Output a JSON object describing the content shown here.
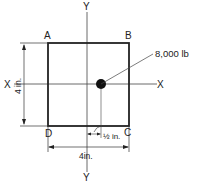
{
  "diagram": {
    "type": "plate-load-diagram",
    "corners": {
      "A": "A",
      "B": "B",
      "C": "C",
      "D": "D"
    },
    "axes": {
      "x_left": "X",
      "x_right": "X",
      "y_top": "Y",
      "y_bottom": "Y"
    },
    "load": {
      "label": "8,000 lb",
      "value": 8000,
      "unit": "lb"
    },
    "dimensions": {
      "height": "4 in.",
      "width": "4in.",
      "offset": "½ in."
    },
    "colors": {
      "line": "#222222",
      "background": "#ffffff"
    }
  }
}
